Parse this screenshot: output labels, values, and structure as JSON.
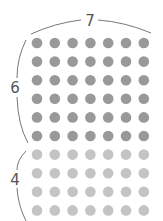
{
  "diagram": {
    "top_label": "7",
    "left_top_label": "6",
    "left_bottom_label": "4",
    "columns": 7,
    "rows_dark": 6,
    "rows_light": 4,
    "colors": {
      "dark_dot": "#999999",
      "light_dot": "#c4c4c4",
      "brace": "#777777",
      "label": "#555555"
    }
  }
}
